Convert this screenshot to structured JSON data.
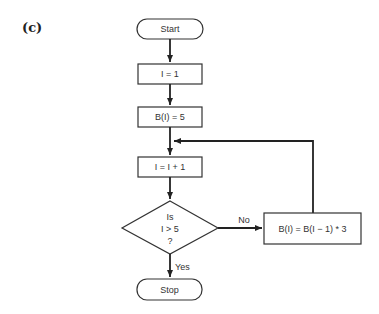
{
  "figure": {
    "label": "(c)"
  },
  "flowchart": {
    "start": "Start",
    "step1": "I = 1",
    "step2": "B(I) = 5",
    "step3": "I = I + 1",
    "decision": {
      "line1": "Is",
      "line2": "I > 5",
      "line3": "?"
    },
    "no_label": "No",
    "yes_label": "Yes",
    "loop_step": "B(I) = B(I − 1) * 3",
    "stop": "Stop"
  }
}
